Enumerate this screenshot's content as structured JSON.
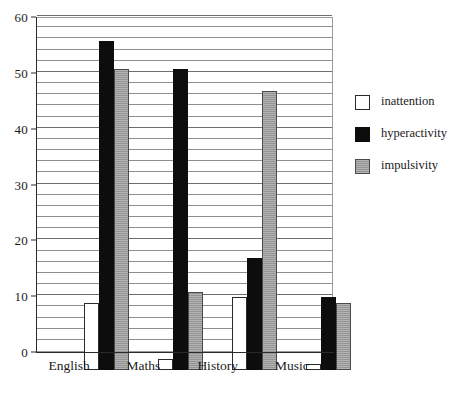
{
  "chart_data": {
    "type": "bar",
    "title": "",
    "subtitle": "",
    "xlabel": "",
    "ylabel": "",
    "categories": [
      "English",
      "Maths",
      "History",
      "Music"
    ],
    "series": [
      {
        "name": "inattention",
        "color": "#ffffff",
        "values": [
          12,
          2,
          13,
          1
        ]
      },
      {
        "name": "hyperactivity",
        "color": "#0d0d0d",
        "values": [
          59,
          54,
          20,
          13
        ]
      },
      {
        "name": "impulsivity",
        "color": "#9d9d9d",
        "values": [
          54,
          14,
          50,
          12
        ]
      }
    ],
    "ylim": [
      0,
      60
    ],
    "y_major_ticks": [
      0,
      10,
      20,
      30,
      40,
      50,
      60
    ],
    "y_tick_labels": [
      "0",
      "10",
      "20",
      "30",
      "40",
      "50",
      "60"
    ],
    "y_gridline_step": 2,
    "grid": true,
    "grid_orientation": "horizontal",
    "legend": true,
    "legend_position": "right",
    "legend_entries": [
      "inattention",
      "hyperactivity",
      "impulsivity"
    ],
    "frame": true
  }
}
